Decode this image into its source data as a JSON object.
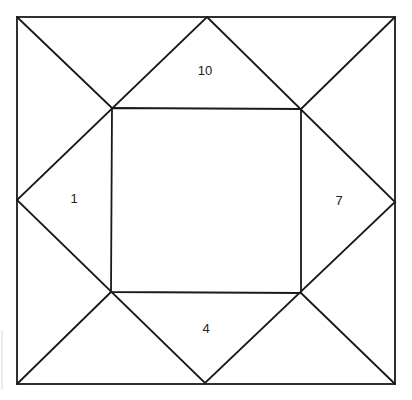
{
  "diagram": {
    "type": "quilt-block-square-in-square",
    "outer_square": {
      "x1": 17,
      "y1": 17,
      "x2": 395,
      "y2": 384
    },
    "midpoints": {
      "top": [
        207,
        17
      ],
      "right": [
        395,
        202
      ],
      "bottom": [
        205,
        383
      ],
      "left": [
        17,
        200
      ]
    },
    "inner_square": {
      "top_left": [
        112,
        108
      ],
      "top_right": [
        301,
        109
      ],
      "bottom_right": [
        301,
        293
      ],
      "bottom_left": [
        111,
        292
      ]
    },
    "labels": [
      {
        "text": "10",
        "x": 205,
        "y": 72,
        "region": "top-triangle"
      },
      {
        "text": "7",
        "x": 339,
        "y": 202,
        "region": "right-triangle"
      },
      {
        "text": "4",
        "x": 206,
        "y": 330,
        "region": "bottom-triangle"
      },
      {
        "text": "1",
        "x": 74,
        "y": 200,
        "region": "left-triangle"
      }
    ],
    "stroke_color": "#1a1a1a",
    "background": "#ffffff"
  }
}
